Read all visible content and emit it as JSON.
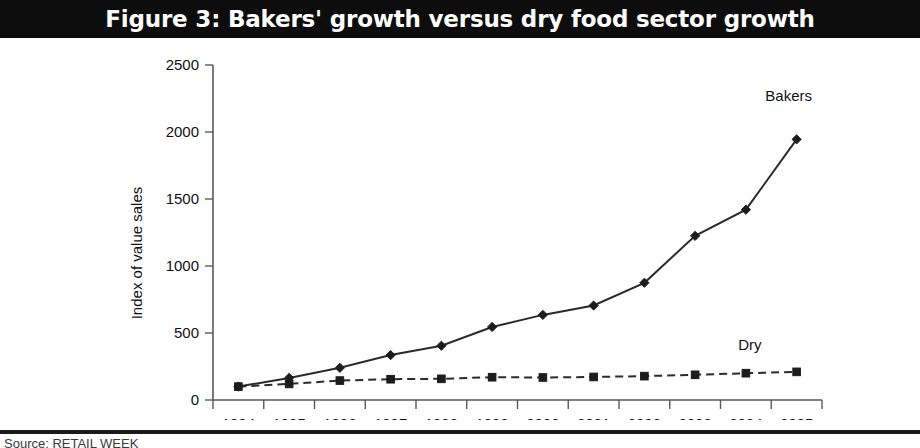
{
  "figure": {
    "title": "Figure 3: Bakers' growth versus dry food sector growth",
    "source_note": "Source: RETAIL WEEK"
  },
  "chart_data": {
    "type": "line",
    "title": "Figure 3: Bakers' growth versus dry food sector growth",
    "xlabel": "",
    "ylabel": "Index of value sales",
    "categories": [
      "1994",
      "1995",
      "1996",
      "1997",
      "1998",
      "1999",
      "2000",
      "2001",
      "2002",
      "2003",
      "2004",
      "2005"
    ],
    "x_tick_labels": [
      "1994",
      "1995",
      "1996",
      "1997",
      "1998",
      "1999",
      "2000",
      "2001",
      "2002",
      "2003",
      "2004",
      "2005"
    ],
    "y_tick_labels": [
      "0",
      "500",
      "1000",
      "1500",
      "2000",
      "2500"
    ],
    "y_ticks": [
      0,
      500,
      1000,
      1500,
      2000,
      2500
    ],
    "ylim": [
      0,
      2500
    ],
    "grid": false,
    "legend_position": "inline-annotation",
    "series": [
      {
        "name": "Bakers",
        "marker": "diamond",
        "line_style": "solid",
        "color": "#1c1c1c",
        "label_text": "Bakers",
        "values": [
          100,
          165,
          240,
          335,
          405,
          545,
          635,
          705,
          875,
          1225,
          1420,
          1945
        ]
      },
      {
        "name": "Dry",
        "marker": "square",
        "line_style": "dashed",
        "color": "#1c1c1c",
        "label_text": "Dry",
        "values": [
          100,
          120,
          145,
          155,
          158,
          170,
          168,
          172,
          178,
          188,
          200,
          210
        ]
      }
    ]
  },
  "axes": {
    "y_axis_title": "Index of value sales"
  }
}
